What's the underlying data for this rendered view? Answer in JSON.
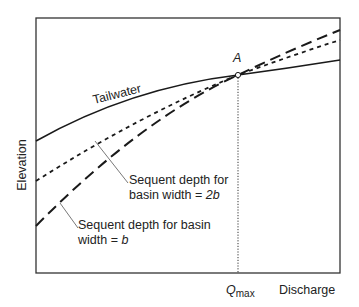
{
  "figure": {
    "y_axis_label": "Elevation",
    "x_axis_label": "Discharge",
    "point_label": "A",
    "qmax_label_main": "Q",
    "qmax_label_sub": "max"
  },
  "curves": [
    {
      "id": "tailwater",
      "label": "Tailwater",
      "style": "solid"
    },
    {
      "id": "sequent-2b",
      "label_line1": "Sequent depth for",
      "label_line2_prefix": "basin width = ",
      "label_line2_var": "2b",
      "style": "dotted"
    },
    {
      "id": "sequent-b",
      "label_line1": "Sequent depth for basin",
      "label_line2_prefix": "width = ",
      "label_line2_var": "b",
      "style": "dashed"
    }
  ],
  "colors": {
    "line": "#1a1a1a",
    "frame": "#333333",
    "text": "#222222",
    "leader": "#555555"
  }
}
